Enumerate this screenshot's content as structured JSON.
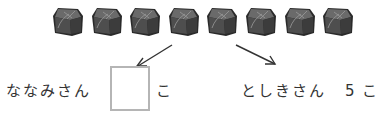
{
  "problem": {
    "items": {
      "count": 8,
      "icon": "candy-piece-icon",
      "colors": {
        "fill": "#4e4e4e",
        "top": "#6a6a6a",
        "edge": "#2a2a2a",
        "highlight": "#9a9a9a"
      }
    },
    "left": {
      "name": "ななみさん",
      "answer_value": "",
      "unit": "こ"
    },
    "right": {
      "name": "としきさん",
      "value": "5",
      "unit": "こ"
    }
  }
}
